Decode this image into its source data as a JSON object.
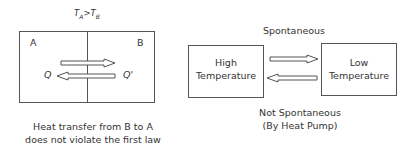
{
  "left_diagram": {
    "condition": {
      "t_a": "T",
      "sub_a": "A",
      "op": ">",
      "t_b": "T",
      "sub_b": "B"
    },
    "region_a_label": "A",
    "region_b_label": "B",
    "q_label": "Q",
    "q_prime_label": "Q'",
    "caption_line1": "Heat transfer from B to A",
    "caption_line2": "does not violate the first law"
  },
  "right_diagram": {
    "top_label": "Spontaneous",
    "high_box": {
      "line1": "High",
      "line2": "Temperature"
    },
    "low_box": {
      "line1": "Low",
      "line2": "Temperature"
    },
    "bottom_label_line1": "Not Spontaneous",
    "bottom_label_line2": "(By Heat Pump)"
  },
  "colors": {
    "line": "#555555",
    "text": "#333333",
    "background": "#ffffff"
  }
}
